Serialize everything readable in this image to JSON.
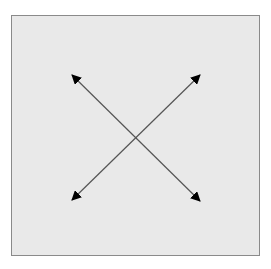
{
  "diagram": {
    "panel": {
      "background": "#e9e9e9",
      "border_color": "#8a8a8a"
    },
    "arrows": [
      {
        "name": "diagonal-arrow-top-left-to-bottom-right",
        "from": [
          71,
          74
        ],
        "to": [
          201,
          202
        ],
        "heads": "both",
        "color": "#111111"
      },
      {
        "name": "diagonal-arrow-top-right-to-bottom-left",
        "from": [
          201,
          74
        ],
        "to": [
          71,
          201
        ],
        "heads": "both",
        "color": "#111111"
      }
    ],
    "line_color": "#555555",
    "arrowhead_color": "#000000"
  }
}
